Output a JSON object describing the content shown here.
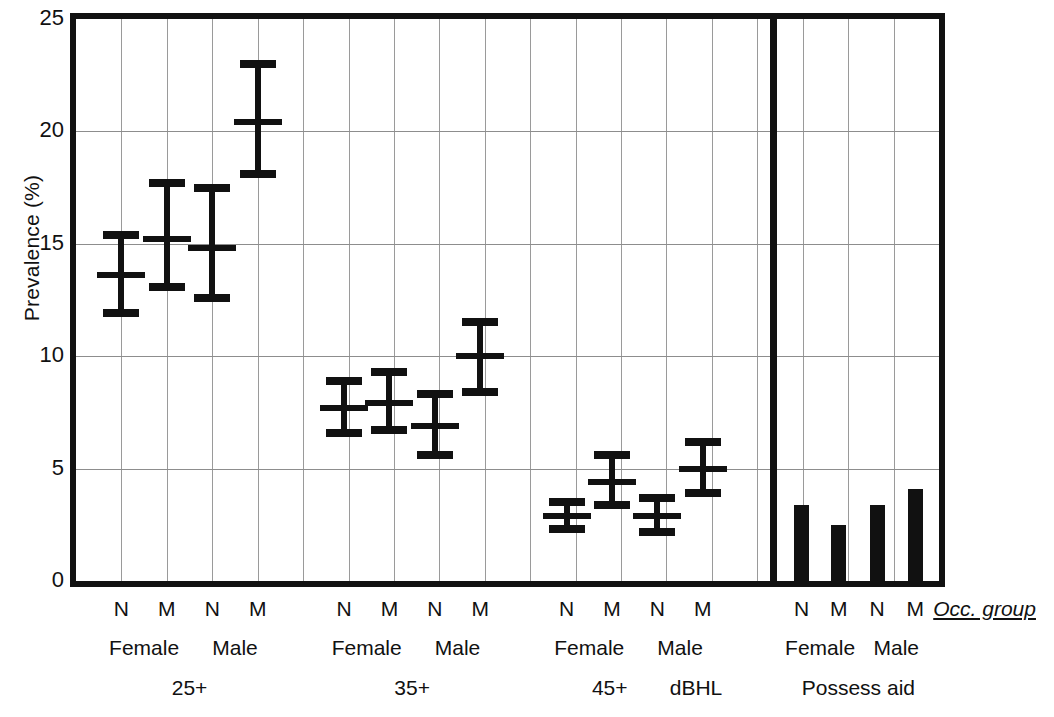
{
  "chart_data": {
    "type": "bar",
    "title": "",
    "xlabel": "Occ. group",
    "ylabel": "Prevalence (%)",
    "ylim": [
      0,
      25
    ],
    "yticks": [
      0,
      5,
      10,
      15,
      20,
      25
    ],
    "grid": true,
    "legend": null,
    "axis_note": "Occ. group",
    "panels": [
      {
        "name": "25+",
        "panel_label": "25+",
        "type": "errorbar",
        "sex_groups": [
          "Female",
          "Male"
        ],
        "categories": [
          "N",
          "M",
          "N",
          "M"
        ],
        "series": [
          {
            "name": "25+ Female N",
            "sex": "Female",
            "occ": "N",
            "value": 13.6,
            "low": 11.9,
            "high": 15.4
          },
          {
            "name": "25+ Female M",
            "sex": "Female",
            "occ": "M",
            "value": 15.2,
            "low": 13.1,
            "high": 17.7
          },
          {
            "name": "25+ Male N",
            "sex": "Male",
            "occ": "N",
            "value": 14.8,
            "low": 12.6,
            "high": 17.5
          },
          {
            "name": "25+ Male M",
            "sex": "Male",
            "occ": "M",
            "value": 20.4,
            "low": 18.1,
            "high": 23.0
          }
        ]
      },
      {
        "name": "35+",
        "panel_label": "35+",
        "type": "errorbar",
        "sex_groups": [
          "Female",
          "Male"
        ],
        "categories": [
          "N",
          "M",
          "N",
          "M"
        ],
        "series": [
          {
            "name": "35+ Female N",
            "sex": "Female",
            "occ": "N",
            "value": 7.7,
            "low": 6.6,
            "high": 8.9
          },
          {
            "name": "35+ Female M",
            "sex": "Female",
            "occ": "M",
            "value": 7.9,
            "low": 6.7,
            "high": 9.3
          },
          {
            "name": "35+ Male N",
            "sex": "Male",
            "occ": "N",
            "value": 6.9,
            "low": 5.6,
            "high": 8.3
          },
          {
            "name": "35+ Male M",
            "sex": "Male",
            "occ": "M",
            "value": 10.0,
            "low": 8.4,
            "high": 11.5
          }
        ]
      },
      {
        "name": "45+ dBHL",
        "panel_label": "45+",
        "panel_label_2": "dBHL",
        "type": "errorbar",
        "sex_groups": [
          "Female",
          "Male"
        ],
        "categories": [
          "N",
          "M",
          "N",
          "M"
        ],
        "series": [
          {
            "name": "45+ Female N",
            "sex": "Female",
            "occ": "N",
            "value": 2.9,
            "low": 2.3,
            "high": 3.5
          },
          {
            "name": "45+ Female M",
            "sex": "Female",
            "occ": "M",
            "value": 4.4,
            "low": 3.4,
            "high": 5.6
          },
          {
            "name": "45+ Male N",
            "sex": "Male",
            "occ": "N",
            "value": 2.9,
            "low": 2.2,
            "high": 3.7
          },
          {
            "name": "45+ Male M",
            "sex": "Male",
            "occ": "M",
            "value": 5.0,
            "low": 3.9,
            "high": 6.2
          }
        ]
      },
      {
        "name": "Possess aid",
        "panel_label": "Possess aid",
        "type": "bar",
        "sex_groups": [
          "Female",
          "Male"
        ],
        "categories": [
          "N",
          "M",
          "N",
          "M"
        ],
        "series": [
          {
            "name": "Aid Female N",
            "sex": "Female",
            "occ": "N",
            "value": 3.4
          },
          {
            "name": "Aid Female M",
            "sex": "Female",
            "occ": "M",
            "value": 2.5
          },
          {
            "name": "Aid Male N",
            "sex": "Male",
            "occ": "N",
            "value": 3.4
          },
          {
            "name": "Aid Male M",
            "sex": "Male",
            "occ": "M",
            "value": 4.1
          }
        ]
      }
    ]
  },
  "axis": {
    "y_title": "Prevalence (%)",
    "y_ticks": [
      "0",
      "5",
      "10",
      "15",
      "20",
      "25"
    ],
    "occ_group_label": "Occ. group"
  },
  "x_labels": {
    "occ_row": [
      "N",
      "M",
      "N",
      "M",
      "N",
      "M",
      "N",
      "M",
      "N",
      "M",
      "N",
      "M",
      "N",
      "M",
      "N",
      "M"
    ],
    "sex_row": [
      "Female",
      "Male",
      "Female",
      "Male",
      "Female",
      "Male",
      "Female",
      "Male"
    ],
    "group_row": [
      "25+",
      "35+",
      "45+",
      "dBHL",
      "Possess aid"
    ]
  },
  "colors": {
    "ink": "#111111",
    "grid": "#8d8d8d",
    "background": "#ffffff"
  }
}
